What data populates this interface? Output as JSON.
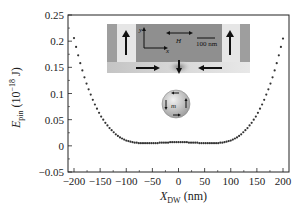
{
  "chart_data": {
    "type": "scatter",
    "title": "",
    "xlabel": "X_DW (nm)",
    "xlabel_main": "X",
    "xlabel_sub": "DW",
    "xlabel_unit": " (nm)",
    "ylabel": "E_pin (10^-18 J)",
    "ylabel_main": "E",
    "ylabel_sub": "pin",
    "ylabel_unit_prefix": " (10",
    "ylabel_unit_exp": "−18",
    "ylabel_unit_suffix": " J)",
    "xlim": [
      -200,
      200
    ],
    "ylim": [
      -0.05,
      0.25
    ],
    "xticks": [
      -200,
      -150,
      -100,
      -50,
      0,
      50,
      100,
      150,
      200
    ],
    "xtick_labels": [
      "−200",
      "−150",
      "−100",
      "−50",
      "0",
      "50",
      "100",
      "150",
      "200"
    ],
    "yticks": [
      -0.05,
      0,
      0.05,
      0.1,
      0.15,
      0.2,
      0.25
    ],
    "ytick_labels": [
      "−0.05",
      "0",
      "0.05",
      "0.1",
      "0.15",
      "0.2",
      "0.25"
    ],
    "grid": false,
    "legend": null,
    "marker_color": "#333333",
    "series": [
      {
        "name": "E_pin",
        "x": [
          -200,
          -196,
          -192,
          -188,
          -184,
          -180,
          -176,
          -172,
          -168,
          -164,
          -160,
          -156,
          -152,
          -148,
          -144,
          -140,
          -136,
          -132,
          -128,
          -124,
          -120,
          -116,
          -112,
          -108,
          -104,
          -100,
          -96,
          -92,
          -88,
          -84,
          -80,
          -76,
          -72,
          -68,
          -64,
          -60,
          -56,
          -52,
          -48,
          -44,
          -40,
          -36,
          -32,
          -28,
          -24,
          -20,
          -16,
          -12,
          -8,
          -4,
          0,
          4,
          8,
          12,
          16,
          20,
          24,
          28,
          32,
          36,
          40,
          44,
          48,
          52,
          56,
          60,
          64,
          68,
          72,
          76,
          80,
          84,
          88,
          92,
          96,
          100,
          104,
          108,
          112,
          116,
          120,
          124,
          128,
          132,
          136,
          140,
          144,
          148,
          152,
          156,
          160,
          164,
          168,
          172,
          176,
          180,
          184,
          188,
          192,
          196,
          200
        ],
        "values": [
          0.206,
          0.189,
          0.173,
          0.158,
          0.144,
          0.131,
          0.119,
          0.108,
          0.098,
          0.088,
          0.079,
          0.071,
          0.063,
          0.056,
          0.05,
          0.044,
          0.039,
          0.034,
          0.03,
          0.026,
          0.022,
          0.019,
          0.016,
          0.014,
          0.012,
          0.01,
          0.009,
          0.008,
          0.007,
          0.006,
          0.006,
          0.005,
          0.005,
          0.005,
          0.005,
          0.005,
          0.005,
          0.005,
          0.005,
          0.005,
          0.005,
          0.006,
          0.006,
          0.006,
          0.006,
          0.006,
          0.007,
          0.007,
          0.007,
          0.007,
          0.007,
          0.007,
          0.007,
          0.007,
          0.007,
          0.006,
          0.006,
          0.006,
          0.006,
          0.006,
          0.005,
          0.005,
          0.005,
          0.005,
          0.005,
          0.005,
          0.005,
          0.005,
          0.005,
          0.005,
          0.006,
          0.006,
          0.007,
          0.008,
          0.009,
          0.01,
          0.012,
          0.014,
          0.016,
          0.019,
          0.022,
          0.026,
          0.03,
          0.034,
          0.039,
          0.044,
          0.05,
          0.056,
          0.063,
          0.071,
          0.079,
          0.088,
          0.098,
          0.108,
          0.119,
          0.131,
          0.144,
          0.158,
          0.173,
          0.189,
          0.205
        ]
      }
    ],
    "annotations": [
      {
        "type": "inset-image",
        "description": "Nanowire domain wall simulation: vertical up arrows at left and right ends, horizontal coordinate axes (x, y), field H double arrow, 100 nm scale bar, bottom arrows pointing right, down, left"
      },
      {
        "type": "inset-icon",
        "description": "Sphere with magnetization m and circulating arrows"
      }
    ]
  },
  "inset": {
    "h_label": "H",
    "scale_label": "100 nm",
    "axis_x_label": "x",
    "axis_y_label": "y",
    "m_label": "m"
  },
  "colors": {
    "axes": "#222222",
    "inset_dark": "#8c8c8c",
    "inset_mid": "#a6a6a6",
    "inset_light": "#e4e4e4",
    "inset_band": "#d2d2d2",
    "sphere": "#bdbdbd"
  }
}
